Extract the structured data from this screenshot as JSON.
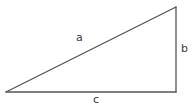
{
  "figure": {
    "name": "right-triangle-diagram",
    "background_color": "#ffffff",
    "stroke_color": "#555555",
    "label_color": "#3a3a3a",
    "stroke_width": 1.3,
    "width": 193,
    "height": 106
  },
  "labels": {
    "hypotenuse": "a",
    "vertical_leg": "b",
    "horizontal_leg": "c"
  },
  "geometry": {
    "vertices": {
      "left": {
        "x": 6,
        "y": 92
      },
      "top_right": {
        "x": 176,
        "y": 7
      },
      "bottom_right": {
        "x": 176,
        "y": 92
      }
    },
    "edges": [
      {
        "name": "hypotenuse",
        "label": "a",
        "from": "left",
        "to": "top_right"
      },
      {
        "name": "vertical-leg",
        "label": "b",
        "from": "top_right",
        "to": "bottom_right"
      },
      {
        "name": "horizontal-leg",
        "label": "c",
        "from": "left",
        "to": "bottom_right"
      }
    ]
  }
}
